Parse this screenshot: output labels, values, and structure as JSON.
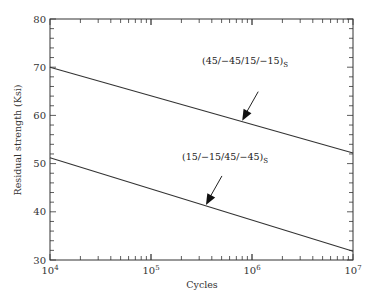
{
  "chart_data": {
    "type": "line",
    "title": "",
    "xlabel": "Cycles",
    "ylabel": "Residual strength (Ksi)",
    "xscale": "log",
    "xlim": [
      10000,
      10000000
    ],
    "ylim": [
      30,
      80
    ],
    "x_ticks": [
      {
        "value": 10000,
        "base": "10",
        "exp": "4"
      },
      {
        "value": 100000,
        "base": "10",
        "exp": "5"
      },
      {
        "value": 1000000,
        "base": "10",
        "exp": "6"
      },
      {
        "value": 10000000,
        "base": "10",
        "exp": "7"
      }
    ],
    "y_ticks": [
      30,
      40,
      50,
      60,
      70,
      80
    ],
    "y_minor_step": 2,
    "grid": false,
    "series": [
      {
        "name": "(45/−45/15/−15)S",
        "label_main": "(45/−45/15/−15)",
        "label_sub": "S",
        "x": [
          10000,
          10000000
        ],
        "y": [
          70,
          52.2
        ]
      },
      {
        "name": "(15/−15/45/−45)S",
        "label_main": "(15/−15/45/−45)",
        "label_sub": "S",
        "x": [
          10000,
          10000000
        ],
        "y": [
          51.2,
          31.8
        ]
      }
    ],
    "annotations": [
      {
        "series": 0,
        "type": "arrow",
        "points_to_x": 800000
      },
      {
        "series": 1,
        "type": "arrow",
        "points_to_x": 350000
      }
    ]
  }
}
